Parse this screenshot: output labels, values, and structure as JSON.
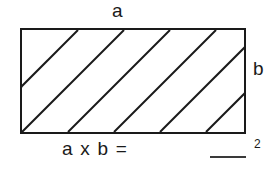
{
  "figure": {
    "background_color": "#ffffff",
    "stroke_color": "#1a1a1a"
  },
  "shape": {
    "name": "rectangle",
    "fill": "#ffffff",
    "border_color": "#1a1a1a",
    "border_width_px": 2,
    "hatch": {
      "pattern": "diagonal-lines",
      "direction": "bottom-left-to-top-right",
      "line_color": "#1a1a1a",
      "line_width_px": 2,
      "visible_line_count": 6,
      "spacing_px": 46,
      "angle_degrees": 45
    }
  },
  "labels": {
    "width_label": "a",
    "height_label": "b"
  },
  "formula": {
    "expression": "a x b =",
    "answer_blank": "",
    "unit_exponent": "2"
  }
}
